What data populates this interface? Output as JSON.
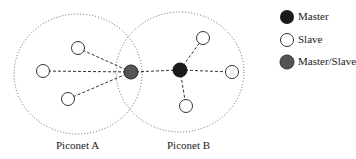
{
  "diagram": {
    "piconets": [
      {
        "label": "Piconet A",
        "cx": 78,
        "cy": 74,
        "rx": 64,
        "ry": 60
      },
      {
        "label": "Piconet B",
        "cx": 180,
        "cy": 72,
        "rx": 64,
        "ry": 60
      }
    ],
    "nodes": [
      {
        "id": "ms",
        "type": "master_slave",
        "x": 131,
        "y": 72
      },
      {
        "id": "mB",
        "type": "master",
        "x": 180,
        "y": 70
      },
      {
        "id": "sA1",
        "type": "slave",
        "x": 78,
        "y": 48
      },
      {
        "id": "sA2",
        "type": "slave",
        "x": 43,
        "y": 71
      },
      {
        "id": "sA3",
        "type": "slave",
        "x": 68,
        "y": 99
      },
      {
        "id": "sB1",
        "type": "slave",
        "x": 203,
        "y": 38
      },
      {
        "id": "sB2",
        "type": "slave",
        "x": 232,
        "y": 72
      },
      {
        "id": "sB3",
        "type": "slave",
        "x": 186,
        "y": 106
      }
    ],
    "edges": [
      [
        "ms",
        "sA1"
      ],
      [
        "ms",
        "sA2"
      ],
      [
        "ms",
        "sA3"
      ],
      [
        "ms",
        "mB"
      ],
      [
        "mB",
        "sB1"
      ],
      [
        "mB",
        "sB2"
      ],
      [
        "mB",
        "sB3"
      ]
    ]
  },
  "legend": [
    {
      "label": "Master",
      "type": "master"
    },
    {
      "label": "Slave",
      "type": "slave"
    },
    {
      "label": "Master/Slave",
      "type": "master_slave"
    }
  ],
  "labels": {
    "piconet_a": "Piconet A",
    "piconet_b": "Piconet B"
  },
  "colors": {
    "master": "#1a1a1a",
    "slave": "#ffffff",
    "master_slave": "#555555",
    "stroke": "#333333"
  }
}
